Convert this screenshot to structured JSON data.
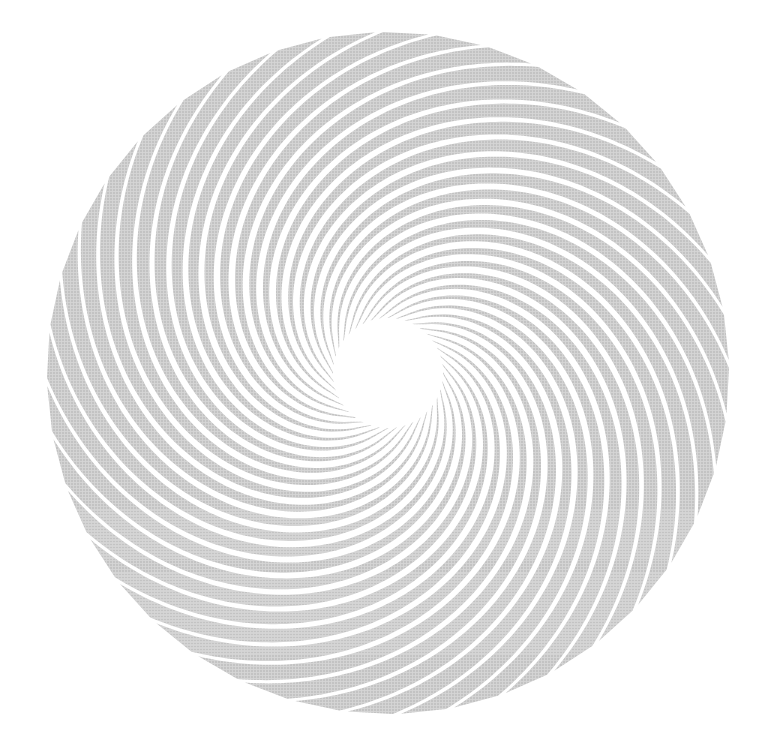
{
  "image": {
    "title": "Spiral rosette figure",
    "width": 777,
    "height": 751,
    "background_color": "#ffffff",
    "description": "Radial arrangement of curved spiral arms forming a disc with a white circular hole at the center"
  },
  "figure": {
    "name": "spiral-rosette",
    "center_x": 388,
    "center_y": 373,
    "outer_radius": 341,
    "inner_radius": 55,
    "arm_count": 40,
    "arm_color": "#c3c3c3",
    "gap_color": "#ffffff",
    "center_hole_color": "#ffffff",
    "sweep_degrees": 165,
    "arm_angular_width_degrees": 7.6,
    "winding": "clockwise-outward",
    "tip_style": "blunt-radial",
    "texture": "halftone-dither"
  },
  "chart_data": {
    "type": "scatter",
    "subtitle": "",
    "xlabel": "",
    "ylabel": "",
    "xlim": [
      0,
      777
    ],
    "ylim": [
      0,
      751
    ],
    "grid": false,
    "legend": "none",
    "annotations": [],
    "tick_labels": {
      "x": [],
      "y": []
    },
    "series": [
      {
        "name": "spiral arms",
        "kind": "parametric-spiral",
        "count": 40,
        "color": "#c3c3c3",
        "r_start": 55,
        "r_end": 341,
        "theta_sweep_deg": 165,
        "angular_width_deg": 7.6,
        "center": [
          388,
          373
        ]
      },
      {
        "name": "center hole",
        "kind": "circle",
        "color": "#ffffff",
        "radius": 55,
        "center": [
          388,
          373
        ]
      }
    ]
  }
}
